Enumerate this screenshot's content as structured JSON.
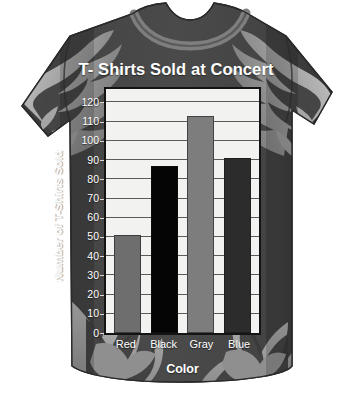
{
  "artwork": {
    "garment": "t-shirt",
    "graphic_motif": "flames",
    "shirt_body_color": "#3f3f3f",
    "shirt_flame_color": "#9a9a9a",
    "shirt_shadow_color": "#2e2e2e",
    "collar_color": "#7c7c7c",
    "background_color": "#ffffff"
  },
  "chart_data": {
    "type": "bar",
    "title": "T- Shirts Sold at Concert",
    "xlabel": "Color",
    "ylabel": "Number of T-Shirts Sold",
    "categories": [
      "Red",
      "Black",
      "Gray",
      "Blue"
    ],
    "values": [
      51,
      87,
      113,
      91
    ],
    "bar_colors": [
      "#6e6e6e",
      "#050505",
      "#7d7d7d",
      "#2c2c2c"
    ],
    "ylim": [
      0,
      127
    ],
    "yticks": [
      0,
      10,
      20,
      30,
      40,
      50,
      60,
      70,
      80,
      90,
      100,
      110,
      120
    ],
    "ytick_labels": [
      "0",
      "10",
      "20",
      "30",
      "40",
      "50",
      "60",
      "70",
      "80",
      "90",
      "100",
      "110",
      "120"
    ],
    "grid": true,
    "grid_axis": "y",
    "legend": false,
    "legend_position": "none",
    "plot_background": "#f2f2f0",
    "plot_border_color": "#141414",
    "gridline_color": "#5a5a5a",
    "text_color": "#ffffff"
  }
}
